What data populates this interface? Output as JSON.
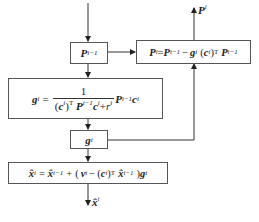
{
  "diagram": {
    "title": "",
    "nodes": [
      {
        "id": "p_prev",
        "label": "P^{i-1}"
      },
      {
        "id": "p_update",
        "label": "P^i = P^{i-1} - g^i (c^i)^T P^{i-1}"
      },
      {
        "id": "gain",
        "label": "g^i = 1 / ((c^i)^T P^{i-1} c^i + r^i) · P^{i-1} c^i"
      },
      {
        "id": "g",
        "label": "g^i"
      },
      {
        "id": "x_update",
        "label": "x̂^i = x̂^{i-1} + (v^i - (c^i)^T x̂^{i-1}) g^i"
      }
    ],
    "edges": [
      {
        "from": "input",
        "to": "p_prev"
      },
      {
        "from": "p_prev",
        "to": "p_update"
      },
      {
        "from": "p_prev",
        "to": "gain"
      },
      {
        "from": "gain",
        "to": "g"
      },
      {
        "from": "g",
        "to": "p_update"
      },
      {
        "from": "g",
        "to": "x_update"
      },
      {
        "from": "p_update",
        "to": "output_P",
        "label": "P^i"
      },
      {
        "from": "x_update",
        "to": "output_x",
        "label": "x̂^i"
      }
    ],
    "text": {
      "P": "P",
      "g": "g",
      "c": "c",
      "r": "r",
      "v": "v",
      "x": "x̂",
      "eq": "=",
      "minus": "−",
      "plus": "+",
      "one": "1",
      "T": "T",
      "sup_i": "i",
      "sup_im1": "i−1",
      "lp": "(",
      "rp": ")"
    },
    "outputs": {
      "P_label_sup": "i",
      "x_label_sup": "i"
    }
  }
}
